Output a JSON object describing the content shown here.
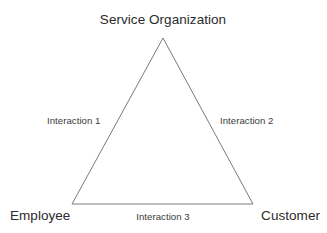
{
  "diagram": {
    "type": "service-triangle",
    "background_color": "#ffffff",
    "stroke_color": "#7a7a7a",
    "text_color": "#2b2b2b",
    "nodes": [
      {
        "id": "service-organization",
        "label": "Service Organization",
        "position": "apex"
      },
      {
        "id": "employee",
        "label": "Employee",
        "position": "bottom-left"
      },
      {
        "id": "customer",
        "label": "Customer",
        "position": "bottom-right"
      }
    ],
    "edges": [
      {
        "id": "interaction-1",
        "label": "Interaction 1",
        "from": "service-organization",
        "to": "employee"
      },
      {
        "id": "interaction-2",
        "label": "Interaction 2",
        "from": "service-organization",
        "to": "customer"
      },
      {
        "id": "interaction-3",
        "label": "Interaction 3",
        "from": "employee",
        "to": "customer"
      }
    ],
    "geometry": {
      "apex": {
        "x": 163,
        "y": 38
      },
      "bottom_left": {
        "x": 72,
        "y": 204
      },
      "bottom_right": {
        "x": 253,
        "y": 204
      },
      "stroke_width": 1
    }
  }
}
